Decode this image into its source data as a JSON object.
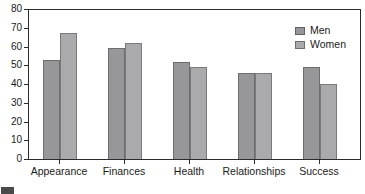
{
  "chart_data": {
    "type": "bar",
    "categories": [
      "Appearance",
      "Finances",
      "Health",
      "Relationships",
      "Success"
    ],
    "series": [
      {
        "name": "Men",
        "values": [
          53,
          59,
          52,
          46,
          49
        ],
        "color": "#97979a"
      },
      {
        "name": "Women",
        "values": [
          67,
          62,
          49,
          46,
          40
        ],
        "color": "#aaaaad"
      }
    ],
    "title": "",
    "xlabel": "",
    "ylabel": "",
    "ylim": [
      0,
      80
    ],
    "yticks": [
      0,
      10,
      20,
      30,
      40,
      50,
      60,
      70,
      80
    ],
    "grid": false,
    "legend_position": "top-right",
    "legend_labels": [
      "Men",
      "Women"
    ],
    "axis_color": "#2b2b2b",
    "background": "#ffffff"
  },
  "misc": {
    "cropped_caption_box": ""
  }
}
